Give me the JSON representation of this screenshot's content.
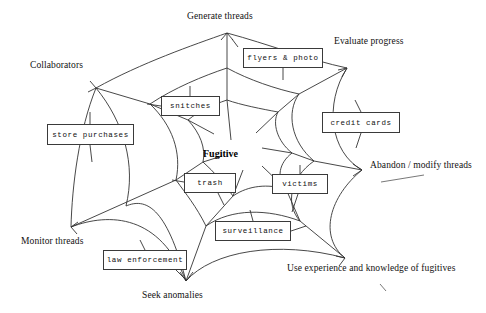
{
  "diagram": {
    "title_center": "Fugitive",
    "type": "spiderweb-mind-map",
    "ink_color": "#333333",
    "background_color": "#ffffff",
    "outer_nodes": [
      {
        "id": "generate-threads",
        "label": "Generate threads",
        "label_x": 187,
        "label_y": 11,
        "vertex_x": 227,
        "vertex_y": 33
      },
      {
        "id": "evaluate-progress",
        "label": "Evaluate progress",
        "label_x": 334,
        "label_y": 36,
        "vertex_x": 347,
        "vertex_y": 68
      },
      {
        "id": "abandon-modify-threads",
        "label": "Abandon / modify threads",
        "label_x": 370,
        "label_y": 160,
        "vertex_x": 362,
        "vertex_y": 170
      },
      {
        "id": "use-experience-knowledge",
        "label": "Use experience and knowledge of fugitives",
        "label_x": 287,
        "label_y": 263,
        "vertex_x": 345,
        "vertex_y": 258
      },
      {
        "id": "seek-anomalies",
        "label": "Seek anomalies",
        "label_x": 142,
        "label_y": 290,
        "vertex_x": 186,
        "vertex_y": 281
      },
      {
        "id": "monitor-threads",
        "label": "Monitor threads",
        "label_x": 21,
        "label_y": 236,
        "vertex_x": 71,
        "vertex_y": 227
      },
      {
        "id": "collaborators",
        "label": "Collaborators",
        "label_x": 30,
        "label_y": 60,
        "vertex_x": 96,
        "vertex_y": 88
      }
    ],
    "node_boxes": [
      {
        "id": "flyers-photo",
        "label": "flyers & photo",
        "x": 243,
        "y": 48,
        "w": 80,
        "h": 20
      },
      {
        "id": "snitches",
        "label": "snitches",
        "x": 161,
        "y": 96,
        "w": 59,
        "h": 20
      },
      {
        "id": "store-purchases",
        "label": "store purchases",
        "x": 47,
        "y": 124,
        "w": 87,
        "h": 21
      },
      {
        "id": "credit-cards",
        "label": "credit cards",
        "x": 322,
        "y": 112,
        "w": 78,
        "h": 21
      },
      {
        "id": "trash",
        "label": "trash",
        "x": 184,
        "y": 173,
        "w": 52,
        "h": 20
      },
      {
        "id": "victims",
        "label": "victims",
        "x": 272,
        "y": 174,
        "w": 56,
        "h": 20
      },
      {
        "id": "surveillance",
        "label": "surveillance",
        "x": 215,
        "y": 221,
        "w": 76,
        "h": 20
      },
      {
        "id": "law-enforcement",
        "label": "law enforcement",
        "x": 103,
        "y": 250,
        "w": 84,
        "h": 20
      }
    ],
    "web_rings": [
      {
        "id": "ring-outer",
        "d": "M 227,33 C 190,44 140,62 96,88 C 120,118 135,160 126,205 C 168,200 226,218 267,245 C 285,205 318,172 362,170 C 342,135 333,96 347,68 C 310,60 265,42 227,33 Z"
      },
      {
        "id": "ring-mid",
        "d": "M 227,66 C 205,74 175,86 150,104 C 166,126 175,152 170,180 C 196,177 231,188 256,205 C 267,180 287,160 314,159 C 296,137 290,113 299,96 C 276,91 250,80 227,66 Z"
      },
      {
        "id": "ring-inner",
        "d": "M 227,95 C 216,100 202,106 190,116 C 198,128 203,142 200,157 C 214,155 232,161 245,170 C 251,157 262,146 277,145 C 268,133 265,120 270,111 C 258,108 239,102 227,95 Z"
      }
    ],
    "spokes": [
      {
        "id": "spoke-generate",
        "d": "M 227,33  L 227,230"
      },
      {
        "id": "spoke-evaluate",
        "d": "M 347,68  L 196,209"
      },
      {
        "id": "spoke-abandon",
        "d": "M 362,170 L 140,168"
      },
      {
        "id": "spoke-experience",
        "d": "M 345,258 L 175,113"
      },
      {
        "id": "spoke-seek",
        "d": "M 186,281 L 248,95"
      },
      {
        "id": "spoke-monitor",
        "d": "M 71,227  L 280,120"
      },
      {
        "id": "spoke-collab",
        "d": "M 96,88   L 300,200"
      }
    ],
    "stray_marks": [
      {
        "id": "stray-abandon",
        "d": "M 381,182 L 424,175"
      },
      {
        "id": "stray-fugitives",
        "d": "M 380,284 L 386,291"
      }
    ]
  }
}
